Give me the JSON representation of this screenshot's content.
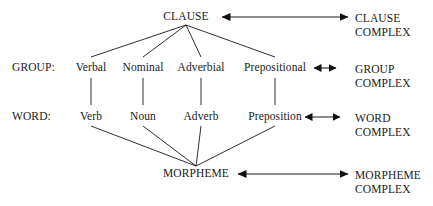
{
  "diagram": {
    "type": "linguistic-rank-scale",
    "ranks": [
      {
        "id": "clause",
        "axis_label": "",
        "head": "CLAUSE",
        "complex": {
          "line1": "CLAUSE",
          "line2": "COMPLEX"
        },
        "arrow": "double-headed"
      },
      {
        "id": "group",
        "axis_label": "GROUP:",
        "head": "",
        "complex": {
          "line1": "GROUP",
          "line2": "COMPLEX"
        },
        "arrow": "double-headed"
      },
      {
        "id": "word",
        "axis_label": "WORD:",
        "head": "",
        "complex": {
          "line1": "WORD",
          "line2": "COMPLEX"
        },
        "arrow": "double-headed"
      },
      {
        "id": "morpheme",
        "axis_label": "",
        "head": "MORPHEME",
        "complex": {
          "line1": "MORPHEME",
          "line2": "COMPLEX"
        },
        "arrow": "double-headed"
      }
    ],
    "group_units": [
      {
        "label": "Verbal",
        "x": 91
      },
      {
        "label": "Nominal",
        "x": 143
      },
      {
        "label": "Adverbial",
        "x": 201
      },
      {
        "label": "Prepositional",
        "x": 275
      }
    ],
    "word_units": [
      {
        "label": "Verb",
        "x": 91
      },
      {
        "label": "Noun",
        "x": 143
      },
      {
        "label": "Adverb",
        "x": 201
      },
      {
        "label": "Preposition",
        "x": 275
      }
    ],
    "apex": {
      "label": "CLAUSE",
      "x": 186,
      "y": 17
    },
    "base": {
      "label": "MORPHEME",
      "x": 196,
      "y": 174
    },
    "colors": {
      "line": "#1a1a1a",
      "text": "#1a1a1a",
      "background": "#ffffff"
    }
  }
}
